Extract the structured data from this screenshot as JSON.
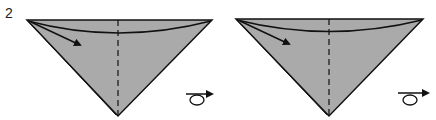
{
  "step": {
    "number": "2"
  },
  "colors": {
    "paper_fill": "#aaaaaa",
    "line": "#111111",
    "background": "#ffffff"
  },
  "panels": [
    {
      "name": "fold-panel-left",
      "icon": "flip-over-icon"
    },
    {
      "name": "fold-panel-right",
      "icon": "flip-over-icon"
    }
  ]
}
